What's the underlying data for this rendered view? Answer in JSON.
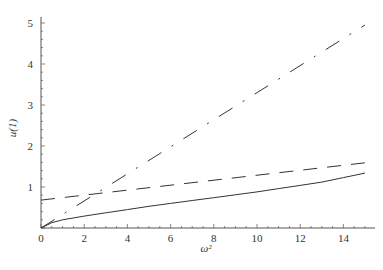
{
  "chart_data": {
    "type": "line",
    "title": "",
    "xlabel": "ω²",
    "ylabel": "u(1)",
    "xlim": [
      0,
      15.5
    ],
    "ylim": [
      0,
      5.1
    ],
    "x_ticks": [
      0,
      2,
      4,
      6,
      8,
      10,
      12,
      14
    ],
    "y_ticks": [
      1,
      2,
      3,
      4,
      5
    ],
    "grid": false,
    "legend": null,
    "series": [
      {
        "name": "solid",
        "style": "solid",
        "x": [
          0,
          0.5,
          1,
          2,
          3,
          4,
          5,
          6,
          7,
          8,
          9,
          10,
          11,
          12,
          13,
          14,
          15
        ],
        "values": [
          0,
          0.13,
          0.2,
          0.29,
          0.37,
          0.45,
          0.53,
          0.6,
          0.67,
          0.74,
          0.81,
          0.88,
          0.96,
          1.04,
          1.12,
          1.23,
          1.34
        ]
      },
      {
        "name": "dashed",
        "style": "dashed",
        "x": [
          0,
          15
        ],
        "values": [
          0.68,
          1.59
        ]
      },
      {
        "name": "dash-dot",
        "style": "dashdot",
        "x": [
          0,
          15
        ],
        "values": [
          0,
          4.95
        ]
      }
    ]
  },
  "plot": {
    "x_axis_label": "ω²",
    "y_axis_label": "u(1)",
    "x_tick_labels": [
      "0",
      "2",
      "4",
      "6",
      "8",
      "10",
      "12",
      "14"
    ],
    "y_tick_labels": [
      "1",
      "2",
      "3",
      "4",
      "5"
    ]
  }
}
